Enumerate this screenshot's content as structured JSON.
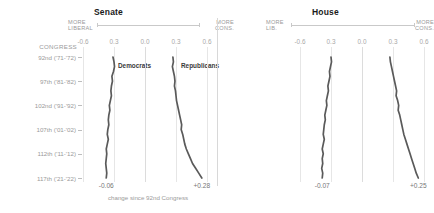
{
  "chart_data": {
    "type": "line",
    "caption": "change since 92nd Congress",
    "xlabel": "DW-NOMINATE first dimension score",
    "ylabel": "CONGRESS",
    "orientation": "vertical-time",
    "xlim": [
      -0.6,
      0.6
    ],
    "xticks": [
      -0.6,
      -0.3,
      0.0,
      0.3,
      0.6
    ],
    "xticklabels": [
      "-0.6",
      "0.3",
      "0.0",
      "0.3",
      "0.6"
    ],
    "grid": true,
    "legend": "inline-labels",
    "y_categories": [
      "92nd ('71-'72)",
      "97th ('81-'82)",
      "102nd ('91-'92)",
      "107th ('01-'02)",
      "112th ('11-'12)",
      "117th ('21-'22)"
    ],
    "panels": [
      {
        "name": "Senate",
        "axis_left_label": "MORE\nLIBERAL",
        "axis_right_label": "MORE\nCONS.",
        "series": [
          {
            "name": "Democrats",
            "end_value_label": "-0.06",
            "end_value": -0.06,
            "x": [
              -0.31,
              -0.3,
              -0.295,
              -0.305,
              -0.32,
              -0.315,
              -0.325,
              -0.33,
              -0.325,
              -0.335,
              -0.345,
              -0.34,
              -0.35,
              -0.355,
              -0.35,
              -0.36,
              -0.365,
              -0.355,
              -0.365,
              -0.375,
              -0.37,
              -0.375,
              -0.38,
              -0.375,
              -0.37,
              -0.375
            ]
          },
          {
            "name": "Republicans",
            "end_value_label": "+0.28",
            "end_value": 0.28,
            "x": [
              0.27,
              0.275,
              0.265,
              0.275,
              0.285,
              0.29,
              0.285,
              0.295,
              0.3,
              0.305,
              0.315,
              0.325,
              0.335,
              0.345,
              0.355,
              0.35,
              0.365,
              0.375,
              0.385,
              0.4,
              0.42,
              0.44,
              0.46,
              0.49,
              0.52,
              0.55
            ]
          }
        ]
      },
      {
        "name": "House",
        "axis_left_label": "MORE\nLIB.",
        "axis_right_label": "MORE\nCONS.",
        "series": [
          {
            "name": "Democrats",
            "end_value_label": "-0.07",
            "end_value": -0.07,
            "x": [
              -0.3,
              -0.295,
              -0.305,
              -0.315,
              -0.31,
              -0.32,
              -0.33,
              -0.325,
              -0.335,
              -0.345,
              -0.34,
              -0.35,
              -0.36,
              -0.355,
              -0.365,
              -0.37,
              -0.375,
              -0.365,
              -0.375,
              -0.385,
              -0.375,
              -0.385,
              -0.38,
              -0.39,
              -0.38,
              -0.385
            ]
          },
          {
            "name": "Republicans",
            "end_value_label": "+0.25",
            "end_value": 0.25,
            "x": [
              0.27,
              0.275,
              0.285,
              0.295,
              0.305,
              0.315,
              0.325,
              0.335,
              0.33,
              0.345,
              0.355,
              0.35,
              0.365,
              0.375,
              0.385,
              0.395,
              0.405,
              0.42,
              0.435,
              0.45,
              0.465,
              0.48,
              0.495,
              0.51,
              0.525,
              0.545
            ]
          }
        ]
      }
    ]
  },
  "senate": {
    "title": "Senate",
    "left_label": "MORE\nLIBERAL",
    "right_label": "MORE\nCONS.",
    "congress_header": "CONGRESS",
    "series_label_dem": "Democrats",
    "series_label_rep": "Republicans",
    "end_dem": "-0.06",
    "end_rep": "+0.28",
    "caption": "change since 92nd Congress",
    "ticks": [
      "-0.6",
      "0.3",
      "0.0",
      "0.3",
      "0.6"
    ],
    "rows": [
      "92nd ('71-'72)",
      "97th ('81-'82)",
      "102nd ('91-'92)",
      "107th ('01-'02)",
      "112th ('11-'12)",
      "117th ('21-'22)"
    ]
  },
  "house": {
    "title": "House",
    "left_label": "MORE\nLIB.",
    "right_label": "MORE\nCONS.",
    "end_dem": "-0.07",
    "end_rep": "+0.25",
    "ticks": [
      "-0.6",
      "0.3",
      "0.0",
      "0.3",
      "0.6"
    ]
  },
  "colors": {
    "line": "#5a5a5a",
    "grid": "#e6e6e6",
    "text": "#9a9a9a",
    "title": "#1a1a1a"
  }
}
